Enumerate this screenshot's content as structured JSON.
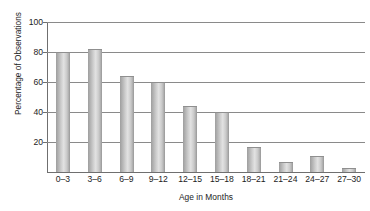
{
  "chart_data": {
    "type": "bar",
    "title": "",
    "xlabel": "Age in Months",
    "ylabel": "Percentage of Observations",
    "categories": [
      "0–3",
      "3–6",
      "6–9",
      "9–12",
      "12–15",
      "15–18",
      "18–21",
      "21–24",
      "24–27",
      "27–30"
    ],
    "values": [
      80,
      82,
      64,
      60,
      44,
      40,
      17,
      7,
      11,
      3
    ],
    "ylim": [
      0,
      100
    ],
    "yticks": [
      "20",
      "40",
      "60",
      "80",
      "100"
    ],
    "ytick_values": [
      20,
      40,
      60,
      80,
      100
    ],
    "grid": true,
    "legend": "none",
    "bar_color": "#c9c9c9",
    "axis_color": "#6f6f6f",
    "grid_color": "#8a8a8a"
  }
}
